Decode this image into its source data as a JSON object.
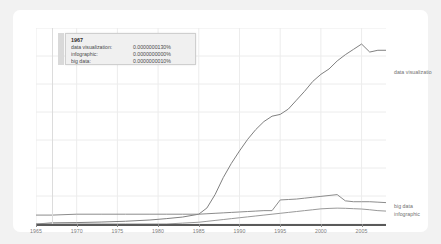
{
  "chart_data": {
    "type": "line",
    "title": "",
    "xlabel": "",
    "ylabel": "",
    "xlim": [
      1965,
      2008
    ],
    "ylim": [
      0,
      2.2e-07
    ],
    "grid": true,
    "legend_position": "right-edge-labels",
    "x_ticks": [
      "1965",
      "1970",
      "1975",
      "1980",
      "1985",
      "1990",
      "1995",
      "2000",
      "2005"
    ],
    "x_tick_values": [
      1965,
      1970,
      1975,
      1980,
      1985,
      1990,
      1995,
      2000,
      2005
    ],
    "y_ticks": [],
    "gridlines_horizontal": 7,
    "x": [
      1965,
      1967,
      1970,
      1973,
      1976,
      1979,
      1981,
      1983,
      1985,
      1986,
      1987,
      1988,
      1989,
      1990,
      1991,
      1992,
      1993,
      1994,
      1995,
      1996,
      1997,
      1998,
      1999,
      2000,
      2001,
      2002,
      2003,
      2004,
      2005,
      2006,
      2007,
      2008
    ],
    "series": [
      {
        "name": "data visualization",
        "color": "#808080",
        "values": [
          0.0,
          1.3e-09,
          1.6e-09,
          2.2e-09,
          3.1e-09,
          4.5e-09,
          6e-09,
          7.8e-09,
          1.1e-08,
          1.8e-08,
          3.3e-08,
          5.2e-08,
          6.8e-08,
          8.2e-08,
          9.5e-08,
          1.06e-07,
          1.15e-07,
          1.21e-07,
          1.23e-07,
          1.29e-07,
          1.39e-07,
          1.49e-07,
          1.6e-07,
          1.68e-07,
          1.74e-07,
          1.83e-07,
          1.9e-07,
          1.96e-07,
          2.02e-07,
          1.93e-07,
          1.95e-07,
          1.95e-07
        ]
      },
      {
        "name": "big data",
        "color": "#8c8c8c",
        "values": [
          1e-08,
          1e-08,
          1.1e-08,
          1.1e-08,
          1.1e-08,
          1.1e-08,
          1.1e-08,
          1.1e-08,
          1.1e-08,
          1.15e-08,
          1.2e-08,
          1.25e-08,
          1.3e-08,
          1.35e-08,
          1.4e-08,
          1.45e-08,
          1.5e-08,
          1.5e-08,
          2.7e-08,
          2.75e-08,
          2.8e-08,
          2.9e-08,
          3e-08,
          3.1e-08,
          3.2e-08,
          3.3e-08,
          2.6e-08,
          2.5e-08,
          2.5e-08,
          2.5e-08,
          2.45e-08,
          2.4e-08
        ]
      },
      {
        "name": "infographic",
        "color": "#999999",
        "values": [
          0.0,
          0.0,
          0.0,
          0.0,
          0.0,
          0.0,
          0.0,
          1e-09,
          2e-09,
          3e-09,
          4e-09,
          5e-09,
          6e-09,
          7e-09,
          8e-09,
          9e-09,
          1e-08,
          1.1e-08,
          1.2e-08,
          1.3e-08,
          1.4e-08,
          1.5e-08,
          1.6e-08,
          1.7e-08,
          1.75e-08,
          1.78e-08,
          1.76e-08,
          1.72e-08,
          1.68e-08,
          1.6e-08,
          1.5e-08,
          1.45e-08
        ]
      }
    ],
    "edge_labels": [
      {
        "name": "data visualization",
        "text": "data visualizatio"
      },
      {
        "name": "big data",
        "text": "big data"
      },
      {
        "name": "infographic",
        "text": "infographic"
      }
    ]
  },
  "tooltip": {
    "year": "1967",
    "rows": [
      {
        "name": "data visualization:",
        "value": "0.0000000130%"
      },
      {
        "name": "infographic:",
        "value": "0.0000000000%"
      },
      {
        "name": "big data:",
        "value": "0.0000000010%"
      }
    ]
  },
  "axis": {
    "x_labels": [
      "1965",
      "1970",
      "1975",
      "1980",
      "1985",
      "1990",
      "1995",
      "2000",
      "2005"
    ]
  },
  "colors": {
    "card_background": "#ffffff",
    "page_background": "#f2f2f2",
    "grid": "#ececec",
    "axis": "#5a5a5a",
    "line": "#808080",
    "tooltip_background": "#f0f0f0",
    "tooltip_border": "#cfcfcf",
    "text": "#7c7c7c"
  }
}
